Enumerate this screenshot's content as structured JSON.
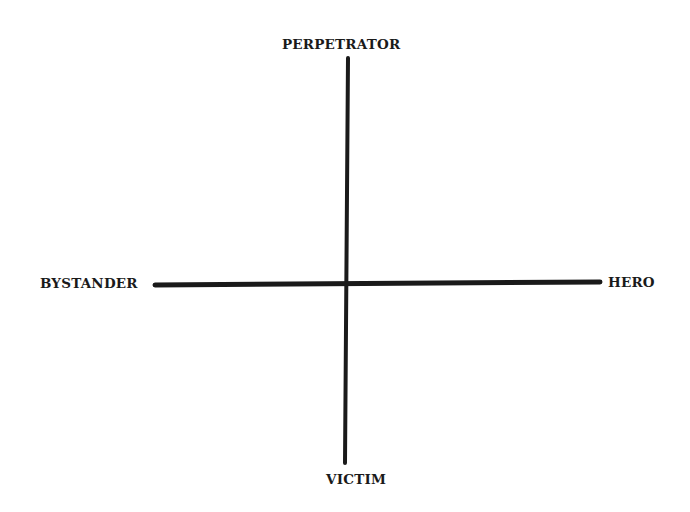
{
  "diagram": {
    "type": "quadrant-axes",
    "axes": {
      "vertical": {
        "top": "PERPETRATOR",
        "bottom": "VICTIM"
      },
      "horizontal": {
        "left": "BYSTANDER",
        "right": "HERO"
      }
    },
    "line_color": "#1a1a1a"
  }
}
